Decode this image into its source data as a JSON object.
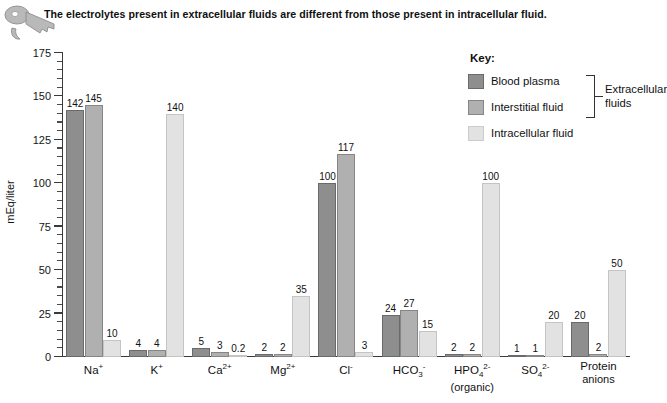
{
  "header": {
    "caption": "The electrolytes present in extracellular fluids are different from those present in intracellular fluid.",
    "icon": "key-icon"
  },
  "legend": {
    "title": "Key:",
    "entries": [
      {
        "label": "Blood plasma",
        "color": "#8e8e8e"
      },
      {
        "label": "Interstitial fluid",
        "color": "#b0b0b0"
      },
      {
        "label": "Intracellular fluid",
        "color": "#e2e2e2"
      }
    ],
    "bracket_label_line1": "Extracellular",
    "bracket_label_line2": "fluids"
  },
  "chart_data": {
    "type": "bar",
    "title": "",
    "xlabel": "",
    "ylabel": "mEq/liter",
    "ylim": [
      0,
      175
    ],
    "yticks": [
      0,
      25,
      50,
      75,
      100,
      125,
      150,
      175
    ],
    "ytick_labels": [
      "0",
      "25",
      "50",
      "75",
      "100",
      "125",
      "150",
      "175"
    ],
    "minor_tick_step": 5,
    "grid": false,
    "legend_position": "upper-right",
    "categories": [
      "Na+",
      "K+",
      "Ca2+",
      "Mg2+",
      "Cl-",
      "HCO3-",
      "HPO4 2- (organic)",
      "SO4 2-",
      "Protein anions"
    ],
    "category_html": [
      {
        "main": "Na",
        "sup": "+",
        "sub": "",
        "second_line": ""
      },
      {
        "main": "K",
        "sup": "+",
        "sub": "",
        "second_line": ""
      },
      {
        "main": "Ca",
        "sup": "2+",
        "sub": "",
        "second_line": ""
      },
      {
        "main": "Mg",
        "sup": "2+",
        "sub": "",
        "second_line": ""
      },
      {
        "main": "Cl",
        "sup": "-",
        "sub": "",
        "second_line": ""
      },
      {
        "main": "HCO",
        "sup": "-",
        "sub": "3",
        "second_line": ""
      },
      {
        "main": "HPO",
        "sup": "2-",
        "sub": "4",
        "second_line": "(organic)"
      },
      {
        "main": "SO",
        "sup": "2-",
        "sub": "4",
        "second_line": ""
      },
      {
        "main": "Protein",
        "sup": "",
        "sub": "",
        "second_line": "anions"
      }
    ],
    "series": [
      {
        "name": "Blood plasma",
        "color": "#8e8e8e",
        "values": [
          142,
          4,
          5,
          2,
          100,
          24,
          2,
          1,
          20
        ]
      },
      {
        "name": "Interstitial fluid",
        "color": "#b0b0b0",
        "values": [
          145,
          4,
          3,
          2,
          117,
          27,
          2,
          1,
          2
        ]
      },
      {
        "name": "Intracellular fluid",
        "color": "#e2e2e2",
        "values": [
          10,
          140,
          0.2,
          35,
          3,
          15,
          100,
          20,
          50
        ]
      }
    ],
    "value_labels": [
      [
        "142",
        "145",
        "10"
      ],
      [
        "4",
        "4",
        "140"
      ],
      [
        "5",
        "3",
        "0.2"
      ],
      [
        "2",
        "2",
        "35"
      ],
      [
        "100",
        "117",
        "3"
      ],
      [
        "24",
        "27",
        "15"
      ],
      [
        "2",
        "2",
        "100"
      ],
      [
        "1",
        "1",
        "20"
      ],
      [
        "20",
        "2",
        "50"
      ]
    ]
  }
}
